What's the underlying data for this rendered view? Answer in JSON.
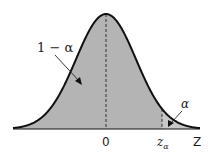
{
  "diagram": {
    "type": "normal-distribution",
    "colors": {
      "fill_main": "#b4b4b4",
      "fill_tail": "#c8c8c8",
      "curve": "#111111",
      "background": "#ffffff"
    },
    "labels": {
      "area_main": "1 − α",
      "area_tail": "α",
      "center_tick": "0",
      "critical_tick": "z",
      "critical_sub": "α",
      "axis": "Z"
    }
  }
}
